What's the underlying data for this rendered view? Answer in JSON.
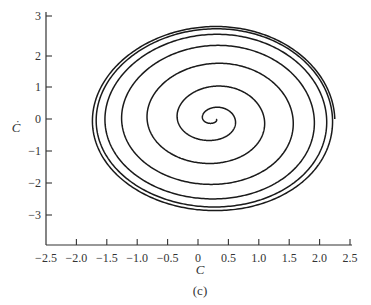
{
  "chart_data": {
    "type": "line",
    "title": "",
    "caption": "(c)",
    "xlabel": "C",
    "ylabel": "Ċ",
    "xlim": [
      -2.5,
      2.5
    ],
    "ylim": [
      -3.6,
      3.2
    ],
    "grid": false,
    "legend": null,
    "x_ticks": [
      -2.5,
      -2.0,
      -1.5,
      -1.0,
      -0.5,
      0,
      0.5,
      1.0,
      1.5,
      2.0,
      2.5
    ],
    "x_tick_labels": [
      "−2.5",
      "−2.0",
      "−1.5",
      "−1.0",
      "−0.5",
      "0",
      "0.5",
      "1.0",
      "1.5",
      "2.0",
      "2.5"
    ],
    "y_ticks": [
      3,
      2,
      1,
      0,
      -1,
      -2,
      -3
    ],
    "y_tick_labels": [
      "3",
      "2",
      "1",
      "0",
      "−1",
      "−2",
      "−3"
    ],
    "series": [
      {
        "name": "phase-trajectory",
        "description": "Outward spiral starting near (0.25, 0) and converging onto a limit cycle",
        "center": [
          0.25,
          0
        ],
        "start_radius": [
          0.05,
          0.05
        ],
        "limit_cycle_semi_axes": [
          2.0,
          2.88
        ],
        "turns": 7
      }
    ]
  }
}
